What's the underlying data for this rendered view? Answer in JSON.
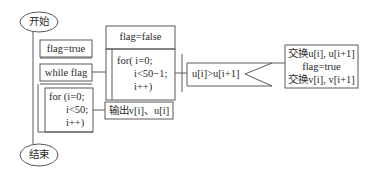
{
  "diagram": {
    "type": "NS-chart (structured flowchart)",
    "start": "开始",
    "end": "结束",
    "init": "flag=true",
    "loop": "while flag",
    "inner_reset": "flag=false",
    "inner_for": {
      "line1": "for( i=0;",
      "line2": "i<50−1;",
      "line3": "i++)"
    },
    "condition": "u[i]>u[i+1]",
    "swap": {
      "line1": "交换u[i], u[i+1]",
      "line2": "flag=true",
      "line3": "交换v[i], v[i+1]"
    },
    "output_for": {
      "line1": "for (i=0;",
      "line2": "i<50;",
      "line3": "i++)"
    },
    "output": "输出v[i]、u[i]"
  },
  "colors": {
    "stroke": "#555555",
    "text": "#2a2a2a",
    "background": "#ffffff"
  }
}
